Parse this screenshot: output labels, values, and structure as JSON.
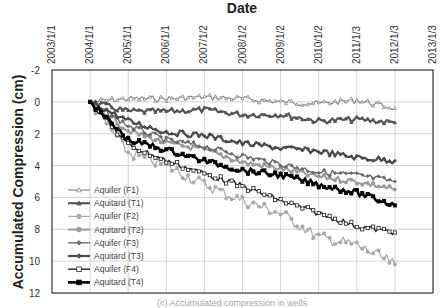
{
  "chart_data": {
    "type": "line",
    "title": "Date",
    "xlabel": "Date",
    "ylabel": "Accumulated Compression (cm)",
    "x_tick_labels": [
      "2003/1/1",
      "2004/1/1",
      "2005/1/1",
      "2006/1/1",
      "2007/1/2",
      "2008/1/2",
      "2009/1/2",
      "2010/1/2",
      "2011/1/3",
      "2012/1/3",
      "2013/1/3"
    ],
    "y_tick_labels": [
      "-2",
      "0",
      "2",
      "4",
      "6",
      "8",
      "10",
      "12"
    ],
    "ylim": [
      -2,
      12
    ],
    "y_inverted": true,
    "x_axis_position": "top",
    "grid": true,
    "legend_position": "lower-left inside",
    "x": [
      2004.0,
      2005.0,
      2006.0,
      2007.0,
      2008.0,
      2009.0,
      2010.0,
      2011.0,
      2012.0
    ],
    "series": [
      {
        "name": "Aquifer (F1)",
        "marker": "triangle-open",
        "color": "#8a8a8a",
        "values": [
          0.0,
          -0.2,
          -0.2,
          -0.3,
          -0.2,
          0.0,
          0.1,
          -0.1,
          0.4
        ]
      },
      {
        "name": "Aquitard (T1)",
        "marker": "triangle",
        "color": "#555555",
        "values": [
          0.0,
          0.6,
          0.6,
          0.5,
          0.8,
          0.8,
          1.2,
          1.1,
          1.3
        ]
      },
      {
        "name": "Aquifer (F2)",
        "marker": "circle",
        "color": "#a8a8a8",
        "values": [
          0.0,
          3.2,
          4.0,
          5.2,
          6.2,
          7.0,
          8.5,
          9.0,
          10.2
        ]
      },
      {
        "name": "Aquitard (T2)",
        "marker": "circle",
        "color": "#9a9a9a",
        "values": [
          0.0,
          1.8,
          2.6,
          3.0,
          3.8,
          4.2,
          4.7,
          5.0,
          5.5
        ]
      },
      {
        "name": "Aquifer (F3)",
        "marker": "diamond",
        "color": "#6a6a6a",
        "values": [
          0.0,
          1.5,
          2.4,
          2.8,
          3.4,
          3.9,
          4.4,
          4.6,
          5.0
        ]
      },
      {
        "name": "Aquitard (T3)",
        "marker": "diamond",
        "color": "#4a4a4a",
        "values": [
          0.0,
          1.2,
          1.9,
          2.1,
          2.6,
          2.9,
          3.1,
          3.5,
          3.7
        ]
      },
      {
        "name": "Aquifer (F4)",
        "marker": "square-open",
        "color": "#222222",
        "values": [
          0.0,
          2.7,
          3.7,
          4.5,
          5.3,
          6.2,
          7.0,
          7.8,
          8.2
        ]
      },
      {
        "name": "Aquitard (T4)",
        "marker": "square",
        "color": "#000000",
        "values": [
          0.0,
          2.4,
          3.0,
          3.7,
          4.3,
          4.6,
          5.2,
          5.7,
          6.5
        ]
      }
    ],
    "caption": "(c) Accumulated compression in wells"
  },
  "labels": {
    "top_title": "Date",
    "y_axis_title": "Accumulated Compression (cm)",
    "caption": "(c) Accumulated compression in wells"
  },
  "legend": [
    {
      "label": "Aquifer (F1)"
    },
    {
      "label": "Aquitard (T1)"
    },
    {
      "label": "Aquifer (F2)"
    },
    {
      "label": "Aquitard (T2)"
    },
    {
      "label": "Aquifer (F3)"
    },
    {
      "label": "Aquitard (T3)"
    },
    {
      "label": "Aquifer (F4)"
    },
    {
      "label": "Aquitard (T4)"
    }
  ]
}
